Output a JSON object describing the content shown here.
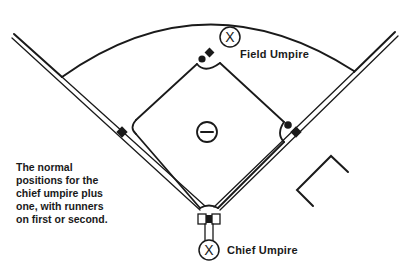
{
  "diagram": {
    "labels": {
      "field_umpire": "Field Umpire",
      "chief_umpire": "Chief Umpire"
    },
    "caption_lines": [
      "The normal",
      "positions for the",
      "chief umpire plus",
      "one, with runners",
      "on first or second."
    ],
    "markers": {
      "umpire_symbol": "X",
      "pitcher_symbol": "minus-in-circle"
    },
    "colors": {
      "ink": "#1a1a1a",
      "background": "#ffffff"
    }
  }
}
